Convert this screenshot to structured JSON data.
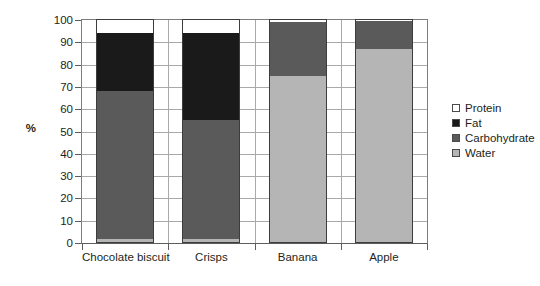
{
  "chart_data": {
    "type": "bar",
    "subtype": "stacked-100-percent",
    "title": "",
    "xlabel": "",
    "ylabel": "%",
    "ylim": [
      0,
      100
    ],
    "ytick_step": 10,
    "yticks": [
      0,
      10,
      20,
      30,
      40,
      50,
      60,
      70,
      80,
      90,
      100
    ],
    "ytick_labels": [
      "0",
      "10",
      "20",
      "30",
      "40",
      "50",
      "60",
      "70",
      "80",
      "90",
      "100"
    ],
    "grid": true,
    "grid_axis": "both",
    "legend_position": "right",
    "categories": [
      "Chocolate biscuit",
      "Crisps",
      "Banana",
      "Apple"
    ],
    "stack_order_bottom_to_top": [
      "Water",
      "Carbohydrate",
      "Fat",
      "Protein"
    ],
    "series": [
      {
        "name": "Water",
        "color": "#b5b5b5",
        "values": [
          2,
          2,
          75,
          87
        ]
      },
      {
        "name": "Carbohydrate",
        "color": "#5a5a5a",
        "values": [
          66,
          53,
          24,
          12.5
        ]
      },
      {
        "name": "Fat",
        "color": "#1a1a1a",
        "values": [
          26,
          39,
          0,
          0
        ]
      },
      {
        "name": "Protein",
        "color": "#ffffff",
        "values": [
          6,
          6,
          1,
          0.5
        ]
      }
    ],
    "cumulative_tops": {
      "Chocolate biscuit": {
        "Water": 2,
        "Carbohydrate": 68,
        "Fat": 94,
        "Protein": 100
      },
      "Crisps": {
        "Water": 2,
        "Carbohydrate": 55,
        "Fat": 94,
        "Protein": 100
      },
      "Banana": {
        "Water": 75,
        "Carbohydrate": 99,
        "Fat": 99,
        "Protein": 100
      },
      "Apple": {
        "Water": 87,
        "Carbohydrate": 99.5,
        "Fat": 99.5,
        "Protein": 100
      }
    }
  },
  "legend": {
    "items": [
      {
        "label": "Protein",
        "color": "#ffffff"
      },
      {
        "label": "Fat",
        "color": "#1a1a1a"
      },
      {
        "label": "Carbohydrate",
        "color": "#5a5a5a"
      },
      {
        "label": "Water",
        "color": "#b5b5b5"
      }
    ]
  },
  "axis": {
    "y_title": "%"
  }
}
